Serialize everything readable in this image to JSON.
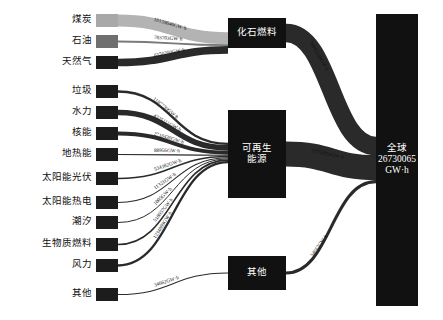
{
  "diagram": {
    "type": "sankey",
    "unit": "GW·h",
    "title": "",
    "colors": {
      "background": "#ffffff",
      "text": "#111111",
      "node_light": "#a8a8a8",
      "node_mid": "#6f6f6f",
      "node_dark": "#1c1c1c",
      "node_black": "#111111",
      "link_light": "#b3b3b3",
      "link_mid": "#7a7a7a",
      "link_dark": "#2a2a2a"
    }
  },
  "sources": [
    {
      "id": "coal",
      "label": "煤炭",
      "value": 10159646,
      "value_label": "10159646GW·h",
      "target": "fossil",
      "shade": "light"
    },
    {
      "id": "oil",
      "label": "石油",
      "value": 783703,
      "value_label": "783703GW·h",
      "target": "fossil",
      "shade": "mid"
    },
    {
      "id": "gas",
      "label": "天然气",
      "value": 6150200,
      "value_label": "6150200GW·h",
      "target": "fossil",
      "shade": "dark"
    },
    {
      "id": "waste",
      "label": "垃圾",
      "value": 1187730,
      "value_label": "1187730GW·h",
      "target": "renewable",
      "shade": "dark"
    },
    {
      "id": "hydro",
      "label": "水力",
      "value": 4325111,
      "value_label": "4325111GW·h",
      "target": "renewable",
      "shade": "dark"
    },
    {
      "id": "nuclear",
      "label": "核能",
      "value": 2710430,
      "value_label": "2710430GW·h",
      "target": "renewable",
      "shade": "dark"
    },
    {
      "id": "geo",
      "label": "地热能",
      "value": 88956,
      "value_label": "88956GW·h",
      "target": "renewable",
      "shade": "dark"
    },
    {
      "id": "solar_pv",
      "label": "太阳能光伏",
      "value": 534382,
      "value_label": "534382GW·h",
      "target": "renewable",
      "shade": "dark"
    },
    {
      "id": "solar_th",
      "label": "太阳能热电",
      "value": 11321,
      "value_label": "11321GW·h",
      "target": "renewable",
      "shade": "dark"
    },
    {
      "id": "tidal",
      "label": "潮汐",
      "value": 1005,
      "value_label": "1005GW·h",
      "target": "renewable",
      "shade": "dark"
    },
    {
      "id": "biomass",
      "label": "生物质燃料",
      "value": 518057,
      "value_label": "518057GW·h",
      "target": "renewable",
      "shade": "dark"
    },
    {
      "id": "wind",
      "label": "风力",
      "value": 1234889,
      "value_label": "1234889GW·h",
      "target": "renewable",
      "shade": "dark"
    },
    {
      "id": "other_src",
      "label": "其他",
      "value": 34662,
      "value_label": "34662GW·h",
      "target": "other",
      "shade": "dark"
    }
  ],
  "mid_nodes": [
    {
      "id": "fossil",
      "label": "化石燃料",
      "lines": [
        "化石燃料"
      ],
      "out_value": 10943549,
      "out_label": "10943549GW·h"
    },
    {
      "id": "renewable",
      "label": "可再生能源",
      "lines": [
        "可再生生",
        "能源"
      ],
      "out_value": 15752054,
      "out_label": "15752054GW·h"
    },
    {
      "id": "other",
      "label": "其他",
      "lines": [
        "其他"
      ],
      "out_value": 34662,
      "out_label": "34662GW·h"
    }
  ],
  "mid_node_text": {
    "fossil": "化石燃料",
    "renewable_line1": "可再生",
    "renewable_line2": "能源",
    "other": "其他"
  },
  "total_node": {
    "id": "global",
    "line1": "全球",
    "line2": "26730065",
    "line3": "GW·h",
    "value": 26730065
  },
  "chart_data": {
    "type": "sankey",
    "title": "",
    "unit": "GW·h",
    "nodes": [
      "煤炭",
      "石油",
      "天然气",
      "垃圾",
      "水力",
      "核能",
      "地热能",
      "太阳能光伏",
      "太阳能热电",
      "潮汐",
      "生物质燃料",
      "风力",
      "其他",
      "化石燃料",
      "可再生能源",
      "其他(中)",
      "全球"
    ],
    "links": [
      {
        "source": "煤炭",
        "target": "化石燃料",
        "value": 10159646
      },
      {
        "source": "石油",
        "target": "化石燃料",
        "value": 783703
      },
      {
        "source": "天然气",
        "target": "化石燃料",
        "value": 6150200
      },
      {
        "source": "垃圾",
        "target": "可再生能源",
        "value": 1187730
      },
      {
        "source": "水力",
        "target": "可再生能源",
        "value": 4325111
      },
      {
        "source": "核能",
        "target": "可再生能源",
        "value": 2710430
      },
      {
        "source": "地热能",
        "target": "可再生能源",
        "value": 88956
      },
      {
        "source": "太阳能光伏",
        "target": "可再生能源",
        "value": 534382
      },
      {
        "source": "太阳能热电",
        "target": "可再生能源",
        "value": 11321
      },
      {
        "source": "潮汐",
        "target": "可再生能源",
        "value": 1005
      },
      {
        "source": "生物质燃料",
        "target": "可再生能源",
        "value": 518057
      },
      {
        "source": "风力",
        "target": "可再生能源",
        "value": 1234889
      },
      {
        "source": "其他",
        "target": "其他(中)",
        "value": 34662
      },
      {
        "source": "化石燃料",
        "target": "全球",
        "value": 10943549
      },
      {
        "source": "可再生能源",
        "target": "全球",
        "value": 15752054
      },
      {
        "source": "其他(中)",
        "target": "全球",
        "value": 34662
      }
    ],
    "totals": {
      "全球": 26730065
    }
  }
}
